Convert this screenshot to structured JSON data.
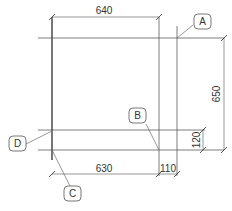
{
  "drawing": {
    "dimensions": {
      "top_width": "640",
      "bottom_left_width": "630",
      "bottom_right_width": "110",
      "right_height": "650",
      "right_small_height": "120"
    },
    "callouts": {
      "a": "A",
      "b": "B",
      "c": "C",
      "d": "D"
    }
  }
}
